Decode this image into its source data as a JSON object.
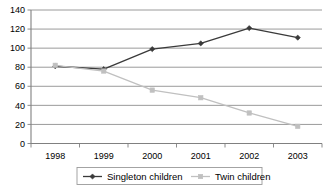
{
  "chart_data": {
    "type": "line",
    "title": "",
    "xlabel": "",
    "ylabel": "",
    "categories": [
      "1998",
      "1999",
      "2000",
      "2001",
      "2002",
      "2003"
    ],
    "x": [
      1998,
      1999,
      2000,
      2001,
      2002,
      2003
    ],
    "ylim": [
      0,
      140
    ],
    "yticks": [
      0,
      20,
      40,
      60,
      80,
      100,
      120,
      140
    ],
    "ytick_labels": [
      "0",
      "20",
      "40",
      "60",
      "80",
      "100",
      "120",
      "140"
    ],
    "grid": true,
    "legend_position": "bottom",
    "series": [
      {
        "name": "Singleton children",
        "values": [
          81,
          78,
          99,
          105,
          121,
          111
        ],
        "color": "#3a3a3a",
        "marker": "diamond"
      },
      {
        "name": "Twin children",
        "values": [
          82,
          76,
          56,
          48,
          32,
          18
        ],
        "color": "#c0c0c0",
        "marker": "square"
      }
    ]
  },
  "legend": {
    "entries": [
      {
        "label": "Singleton children",
        "marker_name": "legend-marker-diamond"
      },
      {
        "label": "Twin children",
        "marker_name": "legend-marker-square"
      }
    ]
  },
  "colors": {
    "singleton": "#3a3a3a",
    "twin": "#c0c0c0",
    "grid": "#808080",
    "axis": "#808080",
    "background": "#ffffff",
    "text": "#000000"
  }
}
